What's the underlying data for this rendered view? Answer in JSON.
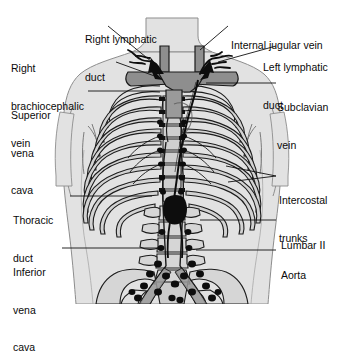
{
  "figure": {
    "type": "anatomical-diagram",
    "background_color": "#ffffff",
    "body_fill": "#e2e2e2",
    "body_outline": "#7a7a7a",
    "bone_fill": "#d9d9d9",
    "bone_outline": "#1a1a1a",
    "vessel_fill": "#8e8e8e",
    "vessel_outline": "#1a1a1a",
    "lymph_color": "#0d0d0d",
    "leader_color": "#111111",
    "text_color": "#0a0a0a"
  },
  "labels": {
    "right_lymphatic_duct": {
      "id": "right-lymphatic-duct",
      "lines": [
        "Right lymphatic",
        "duct"
      ],
      "side": "left"
    },
    "right_brachiocephalic_vein": {
      "id": "right-brachiocephalic-vein",
      "lines": [
        "Right",
        "brachiocephalic",
        "vein"
      ],
      "side": "left"
    },
    "superior_vena_cava": {
      "id": "superior-vena-cava",
      "lines": [
        "Superior",
        "vena",
        "cava"
      ],
      "side": "left"
    },
    "thoracic_duct": {
      "id": "thoracic-duct",
      "lines": [
        "Thoracic",
        "duct"
      ],
      "side": "left"
    },
    "inferior_vena_cava": {
      "id": "inferior-vena-cava",
      "lines": [
        "Inferior",
        "vena",
        "cava"
      ],
      "side": "left"
    },
    "internal_jugular_vein": {
      "id": "internal-jugular-vein",
      "lines": [
        "Internal jugular vein"
      ],
      "side": "right"
    },
    "left_lymphatic_duct": {
      "id": "left-lymphatic-duct",
      "lines": [
        "Left lymphatic",
        "duct"
      ],
      "side": "right"
    },
    "subclavian_vein": {
      "id": "subclavian-vein",
      "lines": [
        "Subclavian",
        "vein"
      ],
      "side": "right"
    },
    "intercostal_trunks": {
      "id": "intercostal-trunks",
      "lines": [
        "Intercostal",
        "trunks"
      ],
      "side": "right"
    },
    "lumbar_ii": {
      "id": "lumbar-ii",
      "lines": [
        "Lumbar II"
      ],
      "side": "right"
    },
    "aorta": {
      "id": "aorta",
      "lines": [
        "Aorta"
      ],
      "side": "right"
    }
  },
  "label_text": {
    "right_lymphatic_duct_1": "Right lymphatic",
    "right_lymphatic_duct_2": "duct",
    "right_brachiocephalic_vein_1": "Right",
    "right_brachiocephalic_vein_2": "brachiocephalic",
    "right_brachiocephalic_vein_3": "vein",
    "superior_vena_cava_1": "Superior",
    "superior_vena_cava_2": "vena",
    "superior_vena_cava_3": "cava",
    "thoracic_duct_1": "Thoracic",
    "thoracic_duct_2": "duct",
    "inferior_vena_cava_1": "Inferior",
    "inferior_vena_cava_2": "vena",
    "inferior_vena_cava_3": "cava",
    "internal_jugular_vein_1": "Internal jugular vein",
    "left_lymphatic_duct_1": "Left lymphatic",
    "left_lymphatic_duct_2": "duct",
    "subclavian_vein_1": "Subclavian",
    "subclavian_vein_2": "vein",
    "intercostal_trunks_1": "Intercostal",
    "intercostal_trunks_2": "trunks",
    "lumbar_ii_1": "Lumbar II",
    "aorta_1": "Aorta"
  }
}
